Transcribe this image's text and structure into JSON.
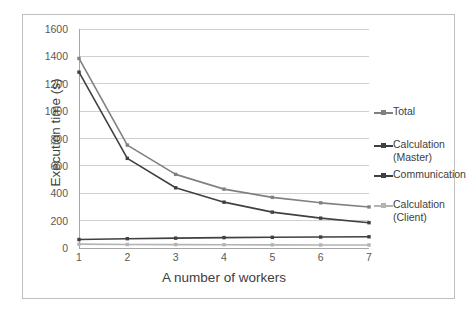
{
  "chart_data": {
    "type": "line",
    "title": "",
    "xlabel": "A number of workers",
    "ylabel": "Execution time (s)",
    "x": [
      1,
      2,
      3,
      4,
      5,
      6,
      7
    ],
    "xticklabels": [
      "1",
      "2",
      "3",
      "4",
      "5",
      "6",
      "7"
    ],
    "yticks": [
      0,
      200,
      400,
      600,
      800,
      1000,
      1200,
      1400,
      1600
    ],
    "yticklabels": [
      "0",
      "200",
      "400",
      "600",
      "800",
      "1000",
      "1200",
      "1400",
      "1600"
    ],
    "ylim": [
      0,
      1600
    ],
    "xlim": [
      1,
      7
    ],
    "grid": "horizontal",
    "legend_position": "right",
    "series": [
      {
        "name": "Total",
        "color": "#808080",
        "values": [
          1385,
          752,
          538,
          430,
          370,
          330,
          300
        ]
      },
      {
        "name": "Calculation (Master)",
        "color": "#404040",
        "values": [
          1285,
          655,
          440,
          335,
          262,
          218,
          185
        ]
      },
      {
        "name": "Communication",
        "color": "#404040",
        "values": [
          62,
          68,
          72,
          76,
          78,
          80,
          82
        ]
      },
      {
        "name": "Calculation (Client)",
        "color": "#b3b3b3",
        "values": [
          28,
          26,
          25,
          24,
          23,
          22,
          22
        ]
      }
    ]
  },
  "legend": {
    "entries": [
      {
        "label": "Total",
        "color": "#808080"
      },
      {
        "label": "Calculation\n(Master)",
        "color": "#404040"
      },
      {
        "label": "Communication",
        "color": "#404040"
      },
      {
        "label": "Calculation\n(Client)",
        "color": "#b3b3b3"
      }
    ]
  },
  "colors": {
    "frame_border": "#bfbfbf",
    "gridline": "#d0d0d0",
    "axis": "#a6a6a6",
    "tick_text": "#595959",
    "axis_title_text": "#404040",
    "background": "#ffffff"
  }
}
